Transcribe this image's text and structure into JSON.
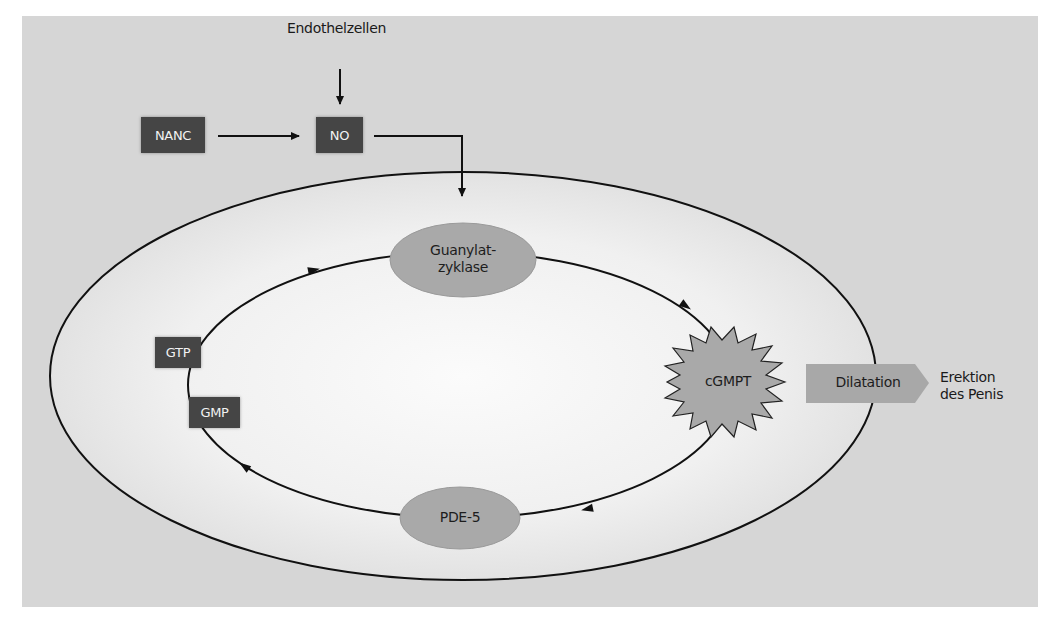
{
  "diagram": {
    "nodes": {
      "endothelzellen": "Endothelzellen",
      "nanc": "NANC",
      "no": "NO",
      "guanylatzyklase_line1": "Guanylat-",
      "guanylatzyklase_line2": "zyklase",
      "cgmpt": "cGMPT",
      "pde5": "PDE-5",
      "gtp": "GTP",
      "gmp": "GMP",
      "dilatation": "Dilatation",
      "erektion_line1": "Erektion",
      "erektion_line2": "des Penis"
    },
    "edges": [
      {
        "from": "Endothelzellen",
        "to": "NO"
      },
      {
        "from": "NANC",
        "to": "NO"
      },
      {
        "from": "NO",
        "to": "Guanylatzyklase"
      },
      {
        "from": "GTP",
        "to": "Guanylatzyklase"
      },
      {
        "from": "Guanylatzyklase",
        "to": "cGMPT"
      },
      {
        "from": "cGMPT",
        "to": "PDE-5"
      },
      {
        "from": "PDE-5",
        "to": "GMP"
      },
      {
        "from": "GMP",
        "to": "GTP"
      },
      {
        "from": "cGMPT",
        "to": "Dilatation"
      },
      {
        "from": "Dilatation",
        "to": "Erektion des Penis"
      }
    ],
    "colors": {
      "panel_bg": "#d6d6d6",
      "dark_box": "#454545",
      "oval_fill": "#a9a9a9",
      "cell_fill_center": "#fafafa",
      "cell_fill_edge": "#e4e4e4",
      "arrow_fill": "#a8a8a8",
      "line": "#111111"
    }
  }
}
